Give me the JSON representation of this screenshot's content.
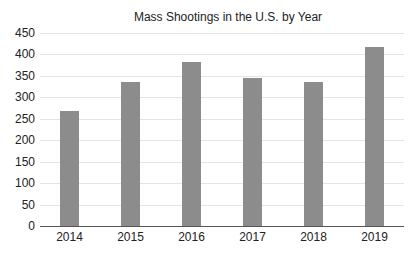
{
  "chart_data": {
    "type": "bar",
    "title": "Mass Shootings in the U.S. by Year",
    "xlabel": "",
    "ylabel": "",
    "categories": [
      "2014",
      "2015",
      "2016",
      "2017",
      "2018",
      "2019"
    ],
    "values": [
      269,
      335,
      382,
      346,
      336,
      417
    ],
    "ylim": [
      0,
      450
    ],
    "yticks": [
      "0",
      "50",
      "100",
      "150",
      "200",
      "250",
      "300",
      "350",
      "400",
      "450"
    ],
    "grid": true,
    "legend": null,
    "bar_color": "#8c8c8c"
  }
}
